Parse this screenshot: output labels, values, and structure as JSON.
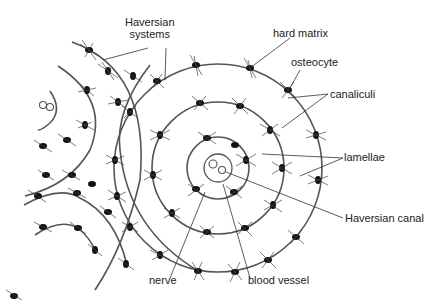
{
  "diagram": {
    "labels": {
      "haversian_systems_line1": "Haversian",
      "haversian_systems_line2": "systems",
      "hard_matrix": "hard matrix",
      "osteocyte": "osteocyte",
      "canaliculi": "canaliculi",
      "lamellae": "lamellae",
      "haversian_canal": "Haversian canal",
      "nerve": "nerve",
      "blood_vessel": "blood vessel"
    },
    "colors": {
      "line": "#444444",
      "cell": "#111111",
      "text": "#222222"
    }
  }
}
